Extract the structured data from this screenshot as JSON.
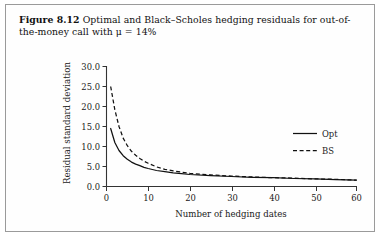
{
  "figure": {
    "label": "Figure 8.12",
    "caption": "Optimal and Black–Scholes hedging residuals for out-of-the-money call with μ = 14%"
  },
  "chart_data": {
    "type": "line",
    "title": "",
    "xlabel": "Number of hedging dates",
    "ylabel": "Residual standard deviation",
    "xlim": [
      0,
      60
    ],
    "ylim": [
      0,
      30
    ],
    "xticks": [
      0,
      10,
      20,
      30,
      40,
      50,
      60
    ],
    "xticklabels": [
      "0",
      "10",
      "20",
      "30",
      "40",
      "50",
      "60"
    ],
    "yticks": [
      0.0,
      5.0,
      10.0,
      15.0,
      20.0,
      25.0,
      30.0
    ],
    "yticklabels": [
      "0.0",
      "5.0",
      "10.0",
      "15.0",
      "20.0",
      "25.0",
      "30.0"
    ],
    "grid": false,
    "legend_position": "right",
    "x": [
      1,
      2,
      3,
      4,
      5,
      6,
      7,
      8,
      9,
      10,
      12,
      14,
      16,
      18,
      20,
      25,
      30,
      35,
      40,
      45,
      50,
      55,
      60
    ],
    "series": [
      {
        "name": "Opt",
        "style": "solid",
        "color": "#111111",
        "values": [
          14.5,
          11.0,
          9.0,
          7.7,
          6.8,
          6.1,
          5.6,
          5.2,
          4.8,
          4.5,
          4.0,
          3.7,
          3.4,
          3.2,
          3.0,
          2.7,
          2.5,
          2.3,
          2.2,
          2.0,
          1.9,
          1.7,
          1.6
        ]
      },
      {
        "name": "BS",
        "style": "dashed",
        "color": "#111111",
        "values": [
          25.0,
          19.2,
          15.0,
          12.1,
          10.2,
          8.8,
          7.8,
          7.0,
          6.3,
          5.8,
          4.9,
          4.3,
          3.9,
          3.6,
          3.3,
          2.9,
          2.6,
          2.4,
          2.2,
          2.1,
          1.9,
          1.8,
          1.6
        ]
      }
    ],
    "legend": [
      {
        "label": "Opt",
        "style": "solid"
      },
      {
        "label": "BS",
        "style": "dashed"
      }
    ]
  }
}
